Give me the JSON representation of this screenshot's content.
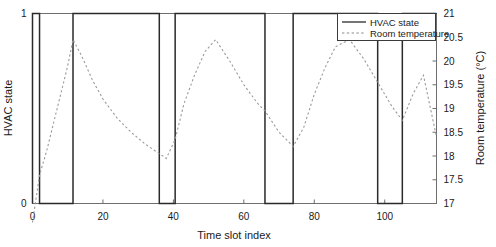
{
  "chart_data": {
    "type": "line",
    "title": "",
    "xlabel": "Time slot index",
    "ylabel": "HVAC state",
    "y2label": "Room temperature (°C)",
    "xlim": [
      0,
      114.7
    ],
    "ylim": [
      0,
      1
    ],
    "y2lim": [
      17,
      21
    ],
    "grid": false,
    "legend_position": "top-right",
    "xticks": [
      0,
      20,
      40,
      60,
      80,
      100
    ],
    "xtick_labels": [
      "0",
      "20",
      "40",
      "60",
      "80",
      "100"
    ],
    "yticks": [
      0,
      1
    ],
    "ytick_labels": [
      "0",
      "1"
    ],
    "y2ticks": [
      17,
      17.5,
      18,
      18.5,
      19,
      19.5,
      20,
      20.5,
      21
    ],
    "y2tick_labels": [
      "17",
      "17.5",
      "18",
      "18.5",
      "19",
      "19.5",
      "20",
      "20.5",
      "21"
    ],
    "series": [
      {
        "name": "HVAC state",
        "axis": "left",
        "style": "solid",
        "color": "#2a2a2a",
        "x": [
          0,
          0,
          2,
          2,
          11.5,
          11.5,
          36,
          36,
          40.5,
          40.5,
          66,
          66,
          74,
          74,
          98,
          98,
          105,
          105,
          114.7
        ],
        "values": [
          0,
          1,
          1,
          0,
          0,
          1,
          1,
          0,
          0,
          1,
          1,
          0,
          0,
          1,
          1,
          0,
          0,
          1,
          1
        ]
      },
      {
        "name": "Room temperature",
        "axis": "right",
        "style": "dashed",
        "color": "#9a9a9a",
        "x": [
          0,
          2,
          4,
          6,
          8,
          10,
          11.5,
          14,
          17,
          20,
          24,
          28,
          32,
          36,
          38,
          40.5,
          43,
          46,
          49,
          52,
          56,
          60,
          64,
          66,
          70,
          74,
          77,
          80,
          83,
          86,
          90,
          94,
          98,
          100,
          102,
          105,
          108,
          111,
          114.7
        ],
        "values": [
          16.6,
          17.6,
          18.1,
          18.7,
          19.3,
          19.9,
          20.45,
          20.1,
          19.6,
          19.2,
          18.8,
          18.5,
          18.25,
          18.05,
          17.95,
          18.35,
          19.1,
          19.7,
          20.2,
          20.45,
          20.0,
          19.5,
          19.1,
          18.95,
          18.5,
          18.2,
          18.6,
          19.3,
          19.85,
          20.3,
          20.45,
          20.05,
          19.55,
          19.3,
          19.05,
          18.75,
          19.3,
          19.7,
          18.4
        ]
      }
    ],
    "legend": [
      {
        "label": "HVAC state",
        "style": "solid",
        "color": "#2a2a2a"
      },
      {
        "label": "Room temperature",
        "style": "dashed",
        "color": "#9a9a9a"
      }
    ]
  },
  "axes": {
    "x_title": "Time slot index",
    "y_left_title": "HVAC state",
    "y_right_title": "Room temperature (°C)"
  },
  "ticks": {
    "x": [
      "0",
      "20",
      "40",
      "60",
      "80",
      "100"
    ],
    "y_left": [
      "0",
      "1"
    ],
    "y_right": [
      "17",
      "17.5",
      "18",
      "18.5",
      "19",
      "19.5",
      "20",
      "20.5",
      "21"
    ]
  },
  "legend": {
    "item1": "HVAC state",
    "item2": "Room temperature"
  },
  "colors": {
    "hvac_line": "#2a2a2a",
    "temperature_line": "#9a9a9a",
    "frame": "#6e6e6e",
    "text": "#1a1a1a",
    "background": "#ffffff"
  }
}
